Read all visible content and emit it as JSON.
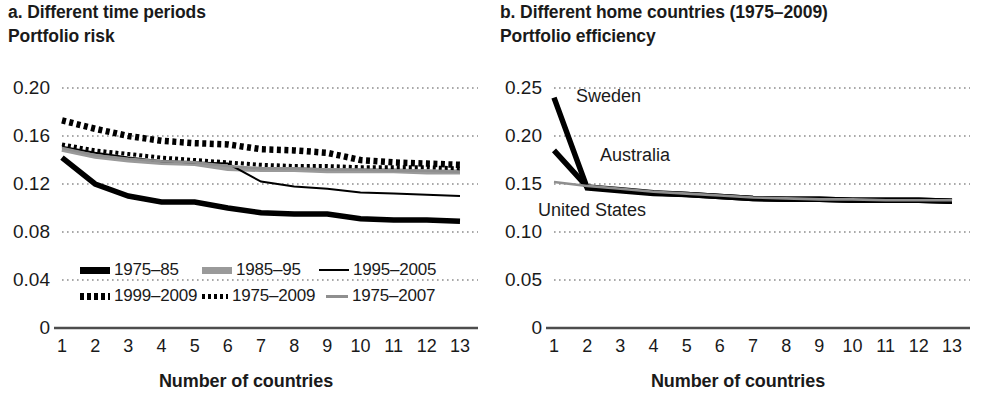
{
  "figure": {
    "panel_a": {
      "title": "a. Different time periods",
      "y_axis_title": "Portfolio risk",
      "x_axis_label": "Number of countries"
    },
    "panel_b": {
      "title": "b. Different home countries (1975–2009)",
      "y_axis_title": "Portfolio efficiency",
      "x_axis_label": "Number of countries"
    }
  },
  "legend": {
    "items": [
      {
        "label": "1975–85",
        "style": "thick-solid-black",
        "color": "#000000"
      },
      {
        "label": "1985–95",
        "style": "thick-solid-gray",
        "color": "#9a9a9a"
      },
      {
        "label": "1995–2005",
        "style": "thin-solid-black",
        "color": "#000000"
      },
      {
        "label": "1999–2009",
        "style": "thick-dotted-black",
        "color": "#000000"
      },
      {
        "label": "1975–2009",
        "style": "thin-dotted-black",
        "color": "#000000"
      },
      {
        "label": "1975–2007",
        "style": "thin-solid-gray",
        "color": "#8f8f8f"
      }
    ]
  },
  "annotations": {
    "sweden": "Sweden",
    "australia": "Australia",
    "united_states": "United States"
  },
  "colors": {
    "black": "#000000",
    "gray": "#9a9a9a",
    "light_gray": "#8f8f8f",
    "grid": "#8d8d8d",
    "axis": "#4d4d4d",
    "text": "#1a1a1a"
  },
  "chart_data": [
    {
      "id": "panel-a",
      "type": "line",
      "title": "a. Different time periods",
      "subtitle": "Portfolio risk",
      "xlabel": "Number of countries",
      "ylabel": "Portfolio risk",
      "x": [
        1,
        2,
        3,
        4,
        5,
        6,
        7,
        8,
        9,
        10,
        11,
        12,
        13
      ],
      "xticklabels": [
        "1",
        "2",
        "3",
        "4",
        "5",
        "6",
        "7",
        "8",
        "9",
        "10",
        "11",
        "12",
        "13"
      ],
      "xlim": [
        1,
        13
      ],
      "ylim": [
        0,
        0.2
      ],
      "yticks": [
        0,
        0.04,
        0.08,
        0.12,
        0.16,
        0.2
      ],
      "yticklabels": [
        "0",
        "0.04",
        "0.08",
        "0.12",
        "0.16",
        "0.20"
      ],
      "grid": "horizontal-dotted",
      "legend_position": "below-plot",
      "series": [
        {
          "name": "1975–85",
          "style": "thick-solid-black",
          "color": "#000000",
          "values": [
            0.142,
            0.12,
            0.11,
            0.105,
            0.105,
            0.1,
            0.096,
            0.095,
            0.095,
            0.091,
            0.09,
            0.09,
            0.089
          ]
        },
        {
          "name": "1985–95",
          "style": "thick-solid-gray",
          "color": "#9a9a9a",
          "values": [
            0.149,
            0.143,
            0.14,
            0.138,
            0.137,
            0.133,
            0.132,
            0.132,
            0.131,
            0.131,
            0.131,
            0.13,
            0.13
          ]
        },
        {
          "name": "1995–2005",
          "style": "thin-solid-black",
          "color": "#000000",
          "values": [
            0.151,
            0.146,
            0.142,
            0.139,
            0.138,
            0.137,
            0.122,
            0.118,
            0.116,
            0.113,
            0.112,
            0.111,
            0.11
          ]
        },
        {
          "name": "1999–2009",
          "style": "thick-dotted-black",
          "color": "#000000",
          "values": [
            0.173,
            0.166,
            0.16,
            0.156,
            0.154,
            0.153,
            0.149,
            0.148,
            0.146,
            0.14,
            0.138,
            0.137,
            0.136
          ]
        },
        {
          "name": "1975–2009",
          "style": "thin-dotted-black",
          "color": "#000000",
          "values": [
            0.153,
            0.148,
            0.145,
            0.142,
            0.14,
            0.138,
            0.136,
            0.135,
            0.135,
            0.134,
            0.134,
            0.134,
            0.133
          ]
        },
        {
          "name": "1975–2007",
          "style": "thin-solid-gray",
          "color": "#8f8f8f",
          "values": [
            0.15,
            0.144,
            0.141,
            0.139,
            0.138,
            0.135,
            0.133,
            0.133,
            0.132,
            0.132,
            0.131,
            0.131,
            0.13
          ]
        }
      ]
    },
    {
      "id": "panel-b",
      "type": "line",
      "title": "b. Different home countries (1975–2009)",
      "subtitle": "Portfolio efficiency",
      "xlabel": "Number of countries",
      "ylabel": "Portfolio efficiency",
      "x": [
        1,
        2,
        3,
        4,
        5,
        6,
        7,
        8,
        9,
        10,
        11,
        12,
        13
      ],
      "xticklabels": [
        "1",
        "2",
        "3",
        "4",
        "5",
        "6",
        "7",
        "8",
        "9",
        "10",
        "11",
        "12",
        "13"
      ],
      "xlim": [
        1,
        13
      ],
      "ylim": [
        0,
        0.25
      ],
      "yticks": [
        0,
        0.05,
        0.1,
        0.15,
        0.2,
        0.25
      ],
      "yticklabels": [
        "0",
        "0.05",
        "0.10",
        "0.15",
        "0.20",
        "0.25"
      ],
      "grid": "horizontal-dotted",
      "legend_position": "inline-annotations",
      "series": [
        {
          "name": "Sweden",
          "style": "thick-solid-black",
          "color": "#000000",
          "values": [
            0.24,
            0.146,
            0.143,
            0.14,
            0.139,
            0.137,
            0.135,
            0.134,
            0.134,
            0.133,
            0.133,
            0.133,
            0.132
          ]
        },
        {
          "name": "Australia",
          "style": "thick-solid-black",
          "color": "#000000",
          "values": [
            0.185,
            0.147,
            0.144,
            0.141,
            0.139,
            0.137,
            0.135,
            0.134,
            0.134,
            0.133,
            0.133,
            0.133,
            0.132
          ]
        },
        {
          "name": "United States",
          "style": "thin-solid-gray",
          "color": "#8f8f8f",
          "values": [
            0.152,
            0.148,
            0.145,
            0.142,
            0.14,
            0.138,
            0.136,
            0.135,
            0.134,
            0.134,
            0.133,
            0.133,
            0.133
          ]
        }
      ]
    }
  ]
}
